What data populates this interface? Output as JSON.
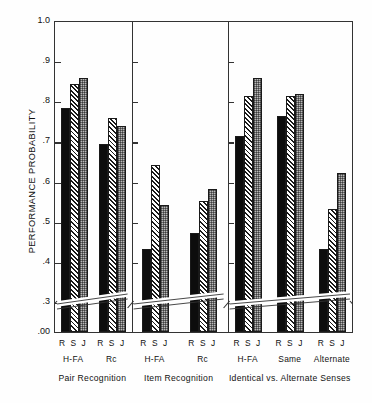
{
  "chart_data": {
    "type": "bar",
    "title": "",
    "xlabel": "",
    "ylabel": "PERFORMANCE PROBABILITY",
    "ylim": [
      0.0,
      1.0
    ],
    "axis_break": {
      "present": true,
      "below": 0.3,
      "base_label": ".00"
    },
    "ytick_labels": [
      "1.0",
      ".9",
      ".8",
      ".7",
      ".6",
      ".5",
      ".4",
      ".3",
      ".00"
    ],
    "ytick_values": [
      1.0,
      0.9,
      0.8,
      0.7,
      0.6,
      0.5,
      0.4,
      0.3,
      0.0
    ],
    "grid": false,
    "legend_position": "none",
    "series": [
      {
        "name": "R",
        "style": "solid-black",
        "values": [
          0.78,
          0.69,
          0.43,
          0.47,
          0.71,
          0.76,
          0.43
        ]
      },
      {
        "name": "S",
        "style": "diagonal-hatch",
        "values": [
          0.84,
          0.755,
          0.64,
          0.55,
          0.81,
          0.81,
          0.53
        ]
      },
      {
        "name": "J",
        "style": "gray-checker",
        "values": [
          0.855,
          0.735,
          0.54,
          0.58,
          0.855,
          0.815,
          0.62
        ]
      }
    ],
    "categories": [
      "H-FA",
      "Rc",
      "H-FA",
      "Rc",
      "H-FA",
      "Same",
      "Alternate"
    ],
    "panels": [
      {
        "label": "Pair Recognition",
        "groups": [
          "H-FA",
          "Rc"
        ]
      },
      {
        "label": "Item Recognition",
        "groups": [
          "H-FA",
          "Rc"
        ]
      },
      {
        "label": "Identical vs. Alternate Senses",
        "groups": [
          "H-FA",
          "Same",
          "Alternate"
        ]
      }
    ],
    "group_tick_label": "R S J",
    "bar_styles": {
      "R": {
        "fill": "#0d0d0d",
        "pattern": "solid"
      },
      "S": {
        "fill": "#ffffff",
        "pattern": "diagonal-hatch"
      },
      "J": {
        "fill": "#b9b9b9",
        "pattern": "checkerboard"
      }
    }
  }
}
